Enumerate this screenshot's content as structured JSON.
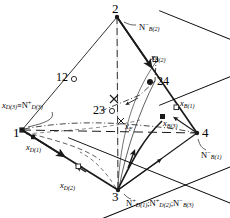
{
  "figure": {
    "type": "tetrahedron-phase-diagram",
    "vertices": [
      {
        "id": "v1",
        "label": "1",
        "x": 22,
        "y": 130
      },
      {
        "id": "v2",
        "label": "2",
        "x": 117,
        "y": 17
      },
      {
        "id": "v3",
        "label": "3",
        "x": 118,
        "y": 190
      },
      {
        "id": "v4",
        "label": "4",
        "x": 197,
        "y": 133
      }
    ],
    "edge_markers": [
      {
        "id": "m12",
        "label": "12",
        "x": 63,
        "y": 78,
        "marker": "open-circle"
      },
      {
        "id": "m24",
        "label": "24",
        "x": 155,
        "y": 81,
        "marker": "filled-circle"
      },
      {
        "id": "m23",
        "label": "23",
        "x": 98,
        "y": 111,
        "marker": "open-circle"
      }
    ],
    "labels": {
      "n_b2": {
        "base": "N",
        "sup": "−",
        "sub": "B(2)",
        "x": 139,
        "y": 24
      },
      "n_b1": {
        "base": "N",
        "sup": "−",
        "sub": "B(1)",
        "x": 203,
        "y": 152
      },
      "x_d3_eq": {
        "text": "x",
        "sub1": "D(3)",
        "eq": "≡",
        "base2": "N",
        "sup2": "+",
        "sub2": "D(3)",
        "x": 4,
        "y": 104
      },
      "x_d1": {
        "base": "x",
        "sub": "D(1)",
        "x": 28,
        "y": 146
      },
      "x_b1": {
        "base": "x",
        "sub": "B(1)",
        "x": 180,
        "y": 104
      },
      "x_b3": {
        "base": "x",
        "sub": "B(3)",
        "x": 164,
        "y": 122
      },
      "x_f": {
        "base": "x",
        "sub": "F",
        "x": 124,
        "y": 126
      },
      "x_b2_crossed": {
        "base": "x",
        "sub": "B(2)",
        "x": 152,
        "y": 56,
        "crossed": true
      },
      "x_d2_crossed": {
        "base": "x",
        "sub": "D(2)",
        "x": 62,
        "y": 174,
        "crossed": true
      },
      "v3_group": {
        "t1": "N",
        "sup1": "+",
        "sub1": "D(1)",
        "sep1": ";",
        "t2": "N",
        "sup2": "+",
        "sub2": "D(2)",
        "sep2": ";",
        "t3": "N",
        "sup3": "−",
        "sub3": "B(3)",
        "x": 128,
        "y": 200
      }
    },
    "colors": {
      "line": "#1a1a1a",
      "background": "#ffffff",
      "marker_fill": "#1a1a1a",
      "marker_open": "#ffffff"
    }
  }
}
